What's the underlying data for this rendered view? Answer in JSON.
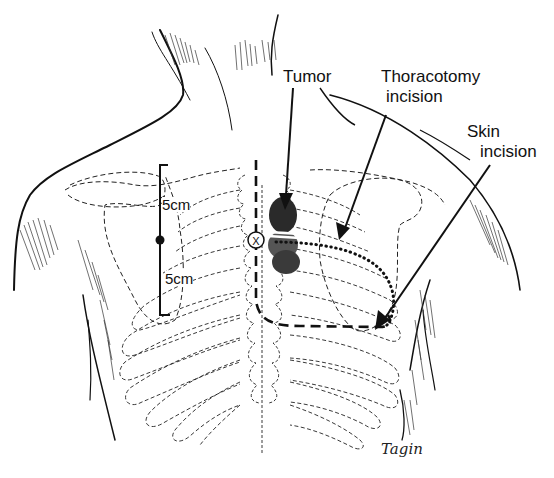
{
  "figure": {
    "colors": {
      "ink": "#111111",
      "background": "#ffffff",
      "tumor_fill": "#333333"
    }
  },
  "labels": {
    "tumor": "Tumor",
    "thoracotomy_line1": "Thoracotomy",
    "thoracotomy_line2": "incision",
    "skin_line1": "Skin",
    "skin_line2": "incision",
    "measure_upper": "5cm",
    "measure_lower": "5cm",
    "marker_x": "X",
    "signature": "Tagin"
  }
}
